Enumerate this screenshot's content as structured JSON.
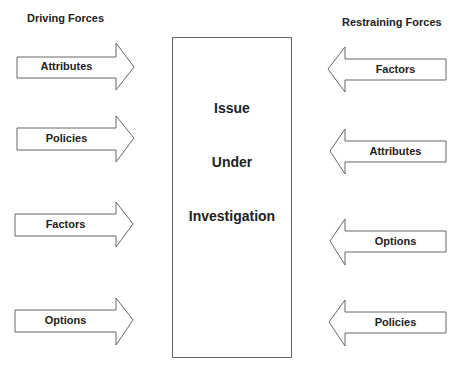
{
  "titles": {
    "driving": "Driving Forces",
    "restraining": "Restraining Forces"
  },
  "center_box": {
    "lines": [
      "Issue",
      "Under",
      "Investigation"
    ]
  },
  "driving_forces": [
    {
      "label": "Attributes"
    },
    {
      "label": "Policies"
    },
    {
      "label": "Factors"
    },
    {
      "label": "Options"
    }
  ],
  "restraining_forces": [
    {
      "label": "Factors"
    },
    {
      "label": "Attributes"
    },
    {
      "label": "Options"
    },
    {
      "label": "Policies"
    }
  ],
  "colors": {
    "stroke": "#666666",
    "fill": "#ffffff",
    "text": "#222222"
  }
}
